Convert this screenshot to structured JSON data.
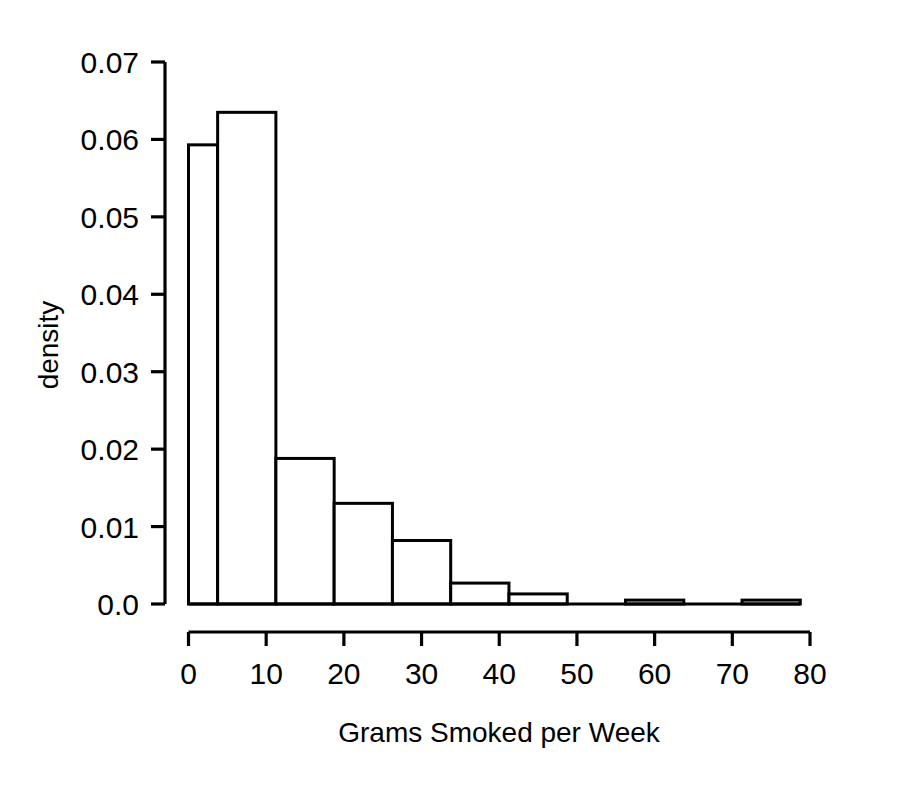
{
  "chart_data": {
    "type": "bar",
    "title": "",
    "subtitle": "",
    "xlabel": "Grams Smoked per Week",
    "ylabel": "density",
    "xlim": [
      0,
      80
    ],
    "ylim": [
      0,
      0.07
    ],
    "grid": false,
    "legend": null,
    "xticks": [
      "0",
      "10",
      "20",
      "30",
      "40",
      "50",
      "60",
      "70",
      "80"
    ],
    "xtick_values": [
      0,
      10,
      20,
      30,
      40,
      50,
      60,
      70,
      80
    ],
    "yticks": [
      "0.0",
      "0.01",
      "0.02",
      "0.03",
      "0.04",
      "0.05",
      "0.06",
      "0.07"
    ],
    "ytick_values": [
      0.0,
      0.01,
      0.02,
      0.03,
      0.04,
      0.05,
      0.06,
      0.07
    ],
    "bin_edges": [
      0,
      3.75,
      11.25,
      18.75,
      26.25,
      33.75,
      41.25,
      48.75,
      56.25,
      63.75,
      71.25,
      78.75
    ],
    "bins": [
      {
        "left": 0,
        "right": 3.75,
        "density": 0.0593
      },
      {
        "left": 3.75,
        "right": 11.25,
        "density": 0.0635
      },
      {
        "left": 11.25,
        "right": 18.75,
        "density": 0.0188
      },
      {
        "left": 18.75,
        "right": 26.25,
        "density": 0.013
      },
      {
        "left": 26.25,
        "right": 33.75,
        "density": 0.0082
      },
      {
        "left": 33.75,
        "right": 41.25,
        "density": 0.0027
      },
      {
        "left": 41.25,
        "right": 48.75,
        "density": 0.0013
      },
      {
        "left": 48.75,
        "right": 56.25,
        "density": 0.0
      },
      {
        "left": 56.25,
        "right": 63.75,
        "density": 0.0005
      },
      {
        "left": 63.75,
        "right": 71.25,
        "density": 0.0
      },
      {
        "left": 71.25,
        "right": 78.75,
        "density": 0.0005
      }
    ],
    "categories": [
      "0-3.75",
      "3.75-11.25",
      "11.25-18.75",
      "18.75-26.25",
      "26.25-33.75",
      "33.75-41.25",
      "41.25-48.75",
      "48.75-56.25",
      "56.25-63.75",
      "63.75-71.25",
      "71.25-78.75"
    ],
    "values": [
      0.0593,
      0.0635,
      0.0188,
      0.013,
      0.0082,
      0.0027,
      0.0013,
      0.0,
      0.0005,
      0.0,
      0.0005
    ]
  },
  "colors": {
    "background": "#ffffff",
    "foreground": "#000000",
    "bar_fill": "#ffffff",
    "bar_stroke": "#000000"
  }
}
